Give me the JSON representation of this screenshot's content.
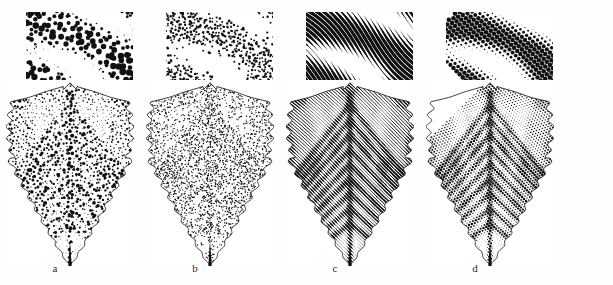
{
  "figure": {
    "background_color": "#ffffff",
    "ink_color": "#111111",
    "panel_count": 4,
    "swatch": {
      "width_px": 107,
      "height_px": 78
    },
    "panels": [
      {
        "label": "a",
        "technique_name": "coarse-stipple",
        "description": "Coarse stipple: large round dots of varying size and spacing form tonal bands",
        "dot_shape": "round",
        "texture_type": "stipple",
        "cell_px": 6,
        "max_dot_radius_px": 2.6,
        "jitter": 0.42,
        "line_angle_deg": 0,
        "swatch_left_px": 26,
        "swatch_top_px": 12
      },
      {
        "label": "b",
        "technique_name": "fine-random-stipple",
        "description": "Fine random stipple: small uniformly sized dots scattered with density proportional to tone",
        "dot_shape": "round",
        "texture_type": "random-stipple",
        "cell_px": 3,
        "max_dot_radius_px": 1.15,
        "jitter": 0.95,
        "line_angle_deg": 0,
        "swatch_left_px": 166,
        "swatch_top_px": 12
      },
      {
        "label": "c",
        "technique_name": "line-hatching",
        "description": "Line engraving: curved parallel hatch lines whose thickness swells and thins with tone",
        "dot_shape": "line",
        "texture_type": "hatching",
        "cell_px": 4,
        "max_dot_radius_px": 2.0,
        "jitter": 0.0,
        "line_angle_deg": 38,
        "swatch_left_px": 306,
        "swatch_top_px": 12
      },
      {
        "label": "d",
        "technique_name": "halftone-screen",
        "description": "Regular halftone screen: square grid of dots on a fixed 45 degree ruling, size modulated by tone",
        "dot_shape": "round",
        "texture_type": "halftone-grid",
        "cell_px": 4.4,
        "max_dot_radius_px": 2.3,
        "jitter": 0.0,
        "line_angle_deg": 45,
        "swatch_left_px": 446,
        "swatch_top_px": 12
      }
    ]
  }
}
